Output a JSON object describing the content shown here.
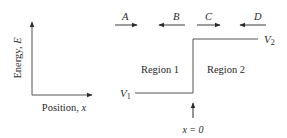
{
  "axes": {
    "y_label": "Energy, ",
    "y_symbol": "E",
    "x_label": "Position, ",
    "x_symbol": "x"
  },
  "waves": [
    {
      "label": "A",
      "direction": "right"
    },
    {
      "label": "B",
      "direction": "left"
    },
    {
      "label": "C",
      "direction": "right"
    },
    {
      "label": "D",
      "direction": "left"
    }
  ],
  "regions": [
    {
      "label": "Region 1"
    },
    {
      "label": "Region 2"
    }
  ],
  "potentials": {
    "v1_symbol": "V",
    "v1_sub": "1",
    "v2_symbol": "V",
    "v2_sub": "2"
  },
  "boundary": {
    "label": "x = 0"
  },
  "colors": {
    "line": "#3a3a3a",
    "text": "#2a2a2a"
  }
}
